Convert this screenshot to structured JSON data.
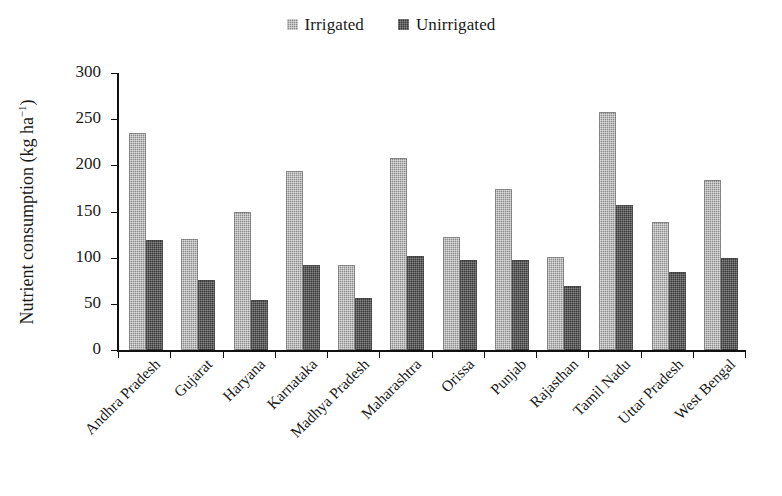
{
  "legend": {
    "position": "top-center",
    "entries": [
      {
        "label": "Irrigated",
        "swatch_name": "legend-swatch-irrigated",
        "color": "#8d8d8d"
      },
      {
        "label": "Unirrigated",
        "swatch_name": "legend-swatch-unirrigated",
        "color": "#3a3a3a"
      }
    ]
  },
  "axes": {
    "ylabel_text": "Nutrient consumption (kg ha",
    "ylabel_sup": "−1",
    "ylabel_close": ")",
    "yticks": [
      "300",
      "250",
      "200",
      "150",
      "100",
      "50",
      "0"
    ]
  },
  "chart_data": {
    "type": "bar",
    "title": "",
    "xlabel": "",
    "ylabel": "Nutrient consumption (kg ha−1)",
    "ylim": [
      0,
      300
    ],
    "ytick_values": [
      0,
      50,
      100,
      150,
      200,
      250,
      300
    ],
    "grid": false,
    "legend_position": "top-center",
    "categories": [
      "Andhra Pradesh",
      "Gujarat",
      "Haryana",
      "Karnataka",
      "Madhya Pradesh",
      "Maharashtra",
      "Orissa",
      "Punjab",
      "Rajasthan",
      "Tamil Nadu",
      "Uttar Pradesh",
      "West Bengal"
    ],
    "series": [
      {
        "name": "Irrigated",
        "color": "#8d8d8d",
        "values": [
          235,
          120,
          150,
          194,
          92,
          208,
          122,
          174,
          101,
          258,
          139,
          184
        ]
      },
      {
        "name": "Unirrigated",
        "color": "#3a3a3a",
        "values": [
          119,
          76,
          54,
          92,
          56,
          102,
          98,
          98,
          69,
          157,
          85,
          100
        ]
      }
    ]
  }
}
